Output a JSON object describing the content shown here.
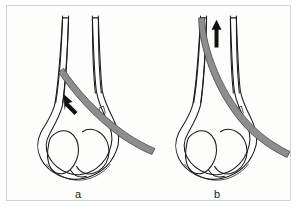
{
  "panel": {
    "background_color": "#fdfdfb",
    "border_color": "#c6d7e3",
    "label_a": "a",
    "label_b": "b"
  },
  "figures": [
    {
      "id": "a",
      "label": "a",
      "caption_label": "a",
      "arrow_name": "insertion-arrow-up-left",
      "arrow_direction": "up-left",
      "description": "Distal femur line drawing with intramedullary nail partially inserted"
    },
    {
      "id": "b",
      "label": "b",
      "caption_label": "b",
      "arrow_name": "insertion-arrow-up",
      "arrow_direction": "up",
      "description": "Distal femur line drawing with intramedullary nail advanced proximally"
    }
  ],
  "colors": {
    "bone_outline": "#1b1b1b",
    "nail_fill": "#8d8d8d",
    "nail_outline": "#3a3a3a",
    "arrow": "#111111",
    "panel_border": "#c6d7e3",
    "panel_background": "#fdfdfb",
    "progress_accent": "#1878c8",
    "progress_track": "#e9eef2",
    "caption_text": "#b9bcbe"
  },
  "bottom_strip": {
    "progress_percent": "66",
    "caption": "· ·· ··· ·· ···"
  }
}
